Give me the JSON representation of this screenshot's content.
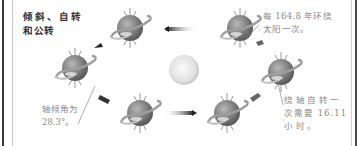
{
  "diagram": {
    "title_lines": [
      "倾斜、自转",
      "和公转"
    ],
    "notes": {
      "orbit": [
        "每 164.8 年环绕",
        "太阳一次。"
      ],
      "tilt": [
        "轴倾角为",
        "28.3°。"
      ],
      "rotation": [
        "绕轴自转一",
        "次需要 16.11",
        "小时。"
      ]
    },
    "elements": {
      "sun": "sun",
      "planet_positions": 6,
      "orbit_direction": "counterclockwise-arrows"
    },
    "colors": {
      "text_title": "#333333",
      "text_note": "#8a8a8a",
      "planet_dark": "#555555",
      "planet_light": "#aaaaaa",
      "sun": "#e6e6e6"
    }
  }
}
